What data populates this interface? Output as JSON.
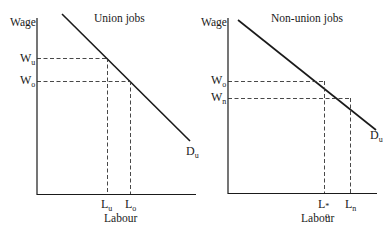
{
  "figure": {
    "panels": [
      {
        "title": "Union jobs",
        "y_axis_label": "Wage",
        "x_axis_label": "Labour",
        "wage_levels": [
          {
            "symbol": "W",
            "subscript": "u",
            "label": "Wu"
          },
          {
            "symbol": "W",
            "subscript": "o",
            "label": "Wo"
          }
        ],
        "labour_levels": [
          {
            "symbol": "L",
            "subscript": "u",
            "label": "Lu"
          },
          {
            "symbol": "L",
            "subscript": "o",
            "label": "Lo"
          }
        ],
        "curve": {
          "symbol": "D",
          "subscript": "u",
          "label": "Du"
        }
      },
      {
        "title": "Non-union jobs",
        "y_axis_label": "Wage",
        "x_axis_label": "Labour",
        "wage_levels": [
          {
            "symbol": "W",
            "subscript": "o",
            "label": "Wo"
          },
          {
            "symbol": "W",
            "subscript": "n",
            "label": "Wn"
          }
        ],
        "labour_levels": [
          {
            "symbol": "L",
            "subscript": "o",
            "superscript": "*",
            "label": "Lo*"
          },
          {
            "symbol": "L",
            "subscript": "n",
            "label": "Ln"
          }
        ],
        "curve": {
          "symbol": "D",
          "subscript": "u",
          "label": "Du"
        }
      }
    ],
    "colors": {
      "line": "#1a1a1a",
      "dashed": "#333333",
      "background": "#ffffff"
    }
  }
}
